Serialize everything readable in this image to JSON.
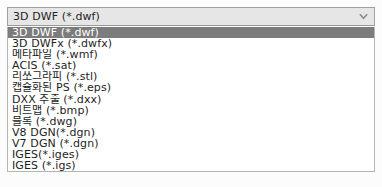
{
  "combobox": {
    "selected_value": "3D DWF (*.dwf)",
    "arrow_icon": "chevron-down-icon"
  },
  "dropdown": {
    "options": [
      {
        "label": "3D DWF (*.dwf)",
        "selected": true
      },
      {
        "label": "3D DWFx (*.dwfx)",
        "selected": false
      },
      {
        "label": "메타파일 (*.wmf)",
        "selected": false
      },
      {
        "label": "ACIS (*.sat)",
        "selected": false
      },
      {
        "label": "리쏘그라피 (*.stl)",
        "selected": false
      },
      {
        "label": "캡슐화된 PS (*.eps)",
        "selected": false
      },
      {
        "label": "DXX 추출 (*.dxx)",
        "selected": false
      },
      {
        "label": "비트맵 (*.bmp)",
        "selected": false
      },
      {
        "label": "블록 (*.dwg)",
        "selected": false
      },
      {
        "label": "V8 DGN(*.dgn)",
        "selected": false
      },
      {
        "label": "V7 DGN (*.dgn)",
        "selected": false
      },
      {
        "label": "IGES(*.iges)",
        "selected": false
      },
      {
        "label": "IGES (*.igs)",
        "selected": false
      }
    ]
  },
  "colors": {
    "selection_background": "#7c7c7c",
    "selection_text": "#ffffff",
    "combobox_background": "#e6e6e6",
    "list_background": "#ffffff",
    "border": "#a0a0a0",
    "text": "#1e1e1e"
  }
}
